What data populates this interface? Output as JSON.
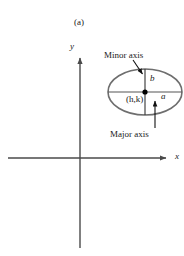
{
  "figure": {
    "panel_label": "(a)",
    "width": 184,
    "height": 256,
    "background_color": "#ffffff"
  },
  "axes": {
    "x_label": "x",
    "y_label": "y",
    "stroke_color": "#4a4a4a",
    "origin": {
      "x": 80,
      "y": 158
    },
    "x_axis": {
      "x_start": 8,
      "x_end": 172,
      "y": 158
    },
    "y_axis": {
      "x": 80,
      "y_start": 52,
      "y_end": 248
    }
  },
  "ellipse": {
    "center_label": "(h,k)",
    "semi_major_label": "a",
    "semi_minor_label": "b",
    "stroke_color": "#6e6e6e",
    "center": {
      "x": 145,
      "y": 92
    },
    "semi_major_px": 37,
    "semi_minor_px": 23,
    "center_dot_color": "#000000"
  },
  "annotations": {
    "minor_axis": {
      "text": "Minor axis",
      "arrow_from": {
        "x": 134,
        "y": 61
      },
      "arrow_to": {
        "x": 144,
        "y": 77
      }
    },
    "major_axis": {
      "text": "Major axis",
      "arrow_from": {
        "x": 155,
        "y": 128
      },
      "arrow_to": {
        "x": 155,
        "y": 98
      }
    }
  }
}
